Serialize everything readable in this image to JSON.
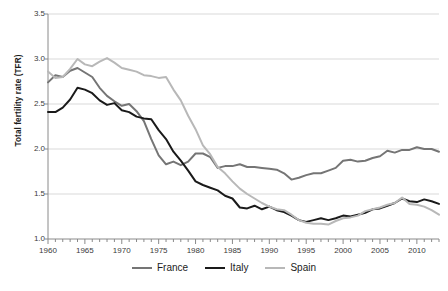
{
  "chart_data": {
    "type": "line",
    "title": "",
    "subtitle": "",
    "xlabel": "",
    "ylabel": "Total fertility rate (TFR)",
    "xlim": [
      1960,
      2013
    ],
    "ylim": [
      1.0,
      3.5
    ],
    "yticks": [
      "1.0",
      "1.5",
      "2.0",
      "2.5",
      "3.0",
      "3.5"
    ],
    "ytick_values": [
      1.0,
      1.5,
      2.0,
      2.5,
      3.0,
      3.5
    ],
    "xticks": [
      "1960",
      "1965",
      "1970",
      "1975",
      "1980",
      "1985",
      "1990",
      "1995",
      "2000",
      "2005",
      "2010"
    ],
    "xtick_values": [
      1960,
      1965,
      1970,
      1975,
      1980,
      1985,
      1990,
      1995,
      2000,
      2005,
      2010
    ],
    "minor_xtick_step": 1,
    "grid": "horizontal",
    "legend_position": "bottom",
    "x": [
      1960,
      1961,
      1962,
      1963,
      1964,
      1965,
      1966,
      1967,
      1968,
      1969,
      1970,
      1971,
      1972,
      1973,
      1974,
      1975,
      1976,
      1977,
      1978,
      1979,
      1980,
      1981,
      1982,
      1983,
      1984,
      1985,
      1986,
      1987,
      1988,
      1989,
      1990,
      1991,
      1992,
      1993,
      1994,
      1995,
      1996,
      1997,
      1998,
      1999,
      2000,
      2001,
      2002,
      2003,
      2004,
      2005,
      2006,
      2007,
      2008,
      2009,
      2010,
      2011,
      2012,
      2013
    ],
    "series": [
      {
        "name": "France",
        "color": "#757575",
        "width": 2.0,
        "values": [
          2.74,
          2.82,
          2.8,
          2.87,
          2.9,
          2.85,
          2.8,
          2.68,
          2.59,
          2.53,
          2.48,
          2.5,
          2.42,
          2.31,
          2.11,
          1.93,
          1.83,
          1.86,
          1.82,
          1.86,
          1.95,
          1.95,
          1.91,
          1.79,
          1.81,
          1.81,
          1.83,
          1.8,
          1.8,
          1.79,
          1.78,
          1.77,
          1.73,
          1.66,
          1.68,
          1.71,
          1.73,
          1.73,
          1.76,
          1.79,
          1.87,
          1.88,
          1.86,
          1.87,
          1.9,
          1.92,
          1.98,
          1.96,
          1.99,
          1.99,
          2.02,
          2.0,
          2.0,
          1.97
        ]
      },
      {
        "name": "Italy",
        "color": "#1a1a1a",
        "width": 2.0,
        "values": [
          2.41,
          2.41,
          2.46,
          2.55,
          2.68,
          2.66,
          2.62,
          2.54,
          2.49,
          2.51,
          2.43,
          2.41,
          2.36,
          2.34,
          2.33,
          2.21,
          2.11,
          1.97,
          1.87,
          1.76,
          1.64,
          1.6,
          1.57,
          1.54,
          1.48,
          1.45,
          1.35,
          1.34,
          1.37,
          1.33,
          1.36,
          1.32,
          1.3,
          1.26,
          1.21,
          1.19,
          1.21,
          1.23,
          1.21,
          1.23,
          1.26,
          1.25,
          1.27,
          1.29,
          1.33,
          1.34,
          1.37,
          1.4,
          1.45,
          1.42,
          1.41,
          1.44,
          1.42,
          1.39
        ]
      },
      {
        "name": "Spain",
        "color": "#b8b8b8",
        "width": 2.0,
        "values": [
          2.86,
          2.79,
          2.8,
          2.89,
          3.0,
          2.94,
          2.92,
          2.97,
          3.01,
          2.96,
          2.9,
          2.88,
          2.86,
          2.82,
          2.81,
          2.79,
          2.8,
          2.66,
          2.54,
          2.37,
          2.22,
          2.04,
          1.94,
          1.8,
          1.73,
          1.64,
          1.56,
          1.5,
          1.45,
          1.4,
          1.36,
          1.33,
          1.32,
          1.27,
          1.21,
          1.18,
          1.17,
          1.17,
          1.16,
          1.2,
          1.23,
          1.24,
          1.26,
          1.31,
          1.33,
          1.35,
          1.38,
          1.4,
          1.46,
          1.39,
          1.38,
          1.36,
          1.32,
          1.27
        ]
      }
    ],
    "legend": [
      {
        "label": "France",
        "color": "#757575"
      },
      {
        "label": "Italy",
        "color": "#1a1a1a"
      },
      {
        "label": "Spain",
        "color": "#b8b8b8"
      }
    ],
    "axis_color": "#8a8a8a",
    "grid_color": "#d9d9d9",
    "background": "#ffffff"
  }
}
